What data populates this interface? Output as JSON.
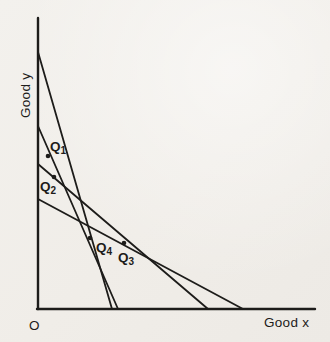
{
  "figure": {
    "background_color": "#f1eee9",
    "ink_color": "#1d1c1a",
    "axes": {
      "y_label": "Good y",
      "x_label": "Good x",
      "origin_label": "O",
      "y_axis": {
        "x": 38,
        "y_top": 18,
        "y_bottom": 309
      },
      "x_axis": {
        "y": 309,
        "x_left": 37,
        "x_right": 315
      }
    },
    "budget_lines": [
      {
        "name": "budget-line-1",
        "x1": 38,
        "y1": 52,
        "x2": 112,
        "y2": 309
      },
      {
        "name": "budget-line-2",
        "x1": 38,
        "y1": 126,
        "x2": 118,
        "y2": 309
      },
      {
        "name": "budget-line-3",
        "x1": 38,
        "y1": 164,
        "x2": 208,
        "y2": 309
      },
      {
        "name": "budget-line-4",
        "x1": 38,
        "y1": 199,
        "x2": 243,
        "y2": 309
      }
    ],
    "points": [
      {
        "label_base": "Q",
        "label_sub": "1",
        "x": 48,
        "y": 156,
        "label_x": 50,
        "label_y": 151
      },
      {
        "label_base": "Q",
        "label_sub": "2",
        "x": 54,
        "y": 177,
        "label_x": 40,
        "label_y": 191
      },
      {
        "label_base": "Q",
        "label_sub": "4",
        "x": 90,
        "y": 238,
        "label_x": 96,
        "label_y": 252
      },
      {
        "label_base": "Q",
        "label_sub": "3",
        "x": 124,
        "y": 243,
        "label_x": 118,
        "label_y": 262
      }
    ]
  }
}
